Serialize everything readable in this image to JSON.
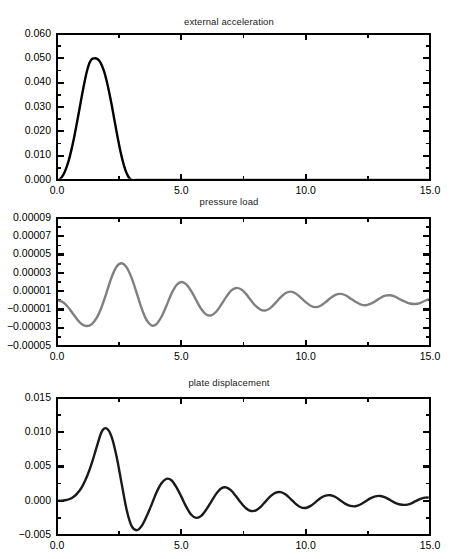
{
  "figure": {
    "background": "#ffffff",
    "width": 458,
    "height": 559
  },
  "chart_data": [
    {
      "type": "line",
      "title": "external acceleration",
      "xlabel": "",
      "ylabel": "",
      "xlim": [
        0.0,
        15.0
      ],
      "ylim": [
        0.0,
        0.06
      ],
      "grid": false,
      "legend": null,
      "color": "#000000",
      "linewidth": 2.4,
      "xticks": [
        0.0,
        5.0,
        10.0,
        15.0
      ],
      "xticklabels": [
        "0.0",
        "5.0",
        "10.0",
        "15.0"
      ],
      "xminorticks": [
        2.5,
        7.5,
        12.5
      ],
      "yticks": [
        0.0,
        0.01,
        0.02,
        0.03,
        0.04,
        0.05,
        0.06
      ],
      "yticklabels": [
        "0.000",
        "0.010",
        "0.020",
        "0.030",
        "0.040",
        "0.050",
        "0.060"
      ],
      "yminorticks": [
        0.005,
        0.015,
        0.025,
        0.035,
        0.045,
        0.055
      ],
      "x": [
        0.0,
        0.1,
        0.2,
        0.3,
        0.4,
        0.5,
        0.6,
        0.7,
        0.8,
        0.9,
        1.0,
        1.1,
        1.2,
        1.3,
        1.4,
        1.5,
        1.6,
        1.7,
        1.8,
        1.9,
        2.0,
        2.1,
        2.2,
        2.3,
        2.4,
        2.5,
        2.6,
        2.7,
        2.8,
        2.9,
        3.0,
        3.2,
        3.5,
        4.0,
        5.0,
        6.0,
        7.0,
        8.0,
        9.0,
        10.0,
        11.0,
        12.0,
        13.0,
        14.0,
        15.0
      ],
      "y": [
        0.0,
        0.0003,
        0.0013,
        0.0031,
        0.0057,
        0.0091,
        0.0133,
        0.0181,
        0.0234,
        0.029,
        0.0346,
        0.0399,
        0.0446,
        0.048,
        0.0497,
        0.05,
        0.0499,
        0.049,
        0.0472,
        0.0444,
        0.0406,
        0.036,
        0.0308,
        0.0252,
        0.0196,
        0.0143,
        0.0096,
        0.0057,
        0.0028,
        0.0009,
        0.0,
        0.0,
        0.0,
        0.0,
        0.0,
        0.0,
        0.0,
        0.0,
        0.0,
        0.0,
        0.0,
        0.0,
        0.0,
        0.0,
        0.0
      ]
    },
    {
      "type": "line",
      "title": "pressure load",
      "xlabel": "",
      "ylabel": "",
      "xlim": [
        0.0,
        15.0
      ],
      "ylim": [
        -5e-05,
        9e-05
      ],
      "grid": false,
      "legend": null,
      "color": "#808080",
      "linewidth": 2.4,
      "xticks": [
        0.0,
        5.0,
        10.0,
        15.0
      ],
      "xticklabels": [
        "0.0",
        "5.0",
        "10.0",
        "15.0"
      ],
      "xminorticks": [
        2.5,
        7.5,
        12.5
      ],
      "yticks": [
        -5e-05,
        -3e-05,
        -1e-05,
        1e-05,
        3e-05,
        5e-05,
        7e-05,
        9e-05
      ],
      "yticklabels": [
        "−0.00005",
        "−0.00003",
        "−0.00001",
        "0.00001",
        "0.00003",
        "0.00005",
        "0.00007",
        "0.00009"
      ],
      "yminorticks": [
        -4e-05,
        -2e-05,
        0.0,
        2e-05,
        4e-05,
        6e-05,
        8e-05
      ],
      "x": [
        0.0,
        0.2,
        0.4,
        0.6,
        0.8,
        1.0,
        1.2,
        1.4,
        1.6,
        1.8,
        2.0,
        2.2,
        2.4,
        2.6,
        2.8,
        3.0,
        3.2,
        3.4,
        3.6,
        3.8,
        4.0,
        4.2,
        4.4,
        4.6,
        4.8,
        5.0,
        5.2,
        5.4,
        5.6,
        5.8,
        6.0,
        6.2,
        6.4,
        6.6,
        6.8,
        7.0,
        7.2,
        7.4,
        7.6,
        7.8,
        8.0,
        8.2,
        8.4,
        8.6,
        8.8,
        9.0,
        9.2,
        9.4,
        9.6,
        9.8,
        10.0,
        10.2,
        10.4,
        10.6,
        10.8,
        11.0,
        11.2,
        11.4,
        11.6,
        11.8,
        12.0,
        12.2,
        12.4,
        12.6,
        12.8,
        13.0,
        13.2,
        13.4,
        13.6,
        13.8,
        14.0,
        14.2,
        14.4,
        14.6,
        14.8,
        15.0
      ],
      "y": [
        0.0,
        -1.5e-06,
        -6e-06,
        -1.3e-05,
        -2.05e-05,
        -2.62e-05,
        -2.82e-05,
        -2.6e-05,
        -1.9e-05,
        -7e-06,
        9e-06,
        2.55e-05,
        3.7e-05,
        4.05e-05,
        3.6e-05,
        2.45e-05,
        8.5e-06,
        -8.5e-06,
        -2.15e-05,
        -2.75e-05,
        -2.6e-05,
        -1.8e-05,
        -6e-06,
        7e-06,
        1.65e-05,
        2e-05,
        1.75e-05,
        1e-05,
        0.0,
        -9.5e-06,
        -1.55e-05,
        -1.65e-05,
        -1.25e-05,
        -5e-06,
        3.5e-06,
        1.05e-05,
        1.35e-05,
        1.2e-05,
        7e-06,
        0.0,
        -6.5e-06,
        -1.05e-05,
        -1.1e-05,
        -8e-06,
        -2.5e-06,
        3.5e-06,
        8e-06,
        9.5e-06,
        7.5e-06,
        3e-06,
        -2e-06,
        -6e-06,
        -7.5e-06,
        -6e-06,
        -2e-06,
        2.5e-06,
        6e-06,
        7e-06,
        5.5e-06,
        2e-06,
        -1.5e-06,
        -4.5e-06,
        -5.5e-06,
        -4e-06,
        -1e-06,
        2.5e-06,
        5e-06,
        5.5e-06,
        4e-06,
        1e-06,
        -1.5e-06,
        -3.5e-06,
        -4e-06,
        -3e-06,
        -5e-07,
        1.5e-06
      ]
    },
    {
      "type": "line",
      "title": "plate displacement",
      "xlabel": "",
      "ylabel": "",
      "xlim": [
        0.0,
        15.0
      ],
      "ylim": [
        -0.005,
        0.015
      ],
      "grid": false,
      "legend": null,
      "color": "#1a1a1a",
      "linewidth": 2.4,
      "xticks": [
        0.0,
        5.0,
        10.0,
        15.0
      ],
      "xticklabels": [
        "0.0",
        "5.0",
        "10.0",
        "15.0"
      ],
      "xminorticks": [
        2.5,
        7.5,
        12.5
      ],
      "yticks": [
        -0.005,
        0.0,
        0.005,
        0.01,
        0.015
      ],
      "yticklabels": [
        "−0.005",
        "0.000",
        "0.005",
        "0.010",
        "0.015"
      ],
      "yminorticks": [
        -0.0025,
        0.0025,
        0.0075,
        0.0125
      ],
      "x": [
        0.0,
        0.2,
        0.4,
        0.6,
        0.8,
        1.0,
        1.2,
        1.4,
        1.6,
        1.8,
        2.0,
        2.2,
        2.4,
        2.6,
        2.8,
        3.0,
        3.2,
        3.4,
        3.6,
        3.8,
        4.0,
        4.2,
        4.4,
        4.6,
        4.8,
        5.0,
        5.2,
        5.4,
        5.6,
        5.8,
        6.0,
        6.2,
        6.4,
        6.6,
        6.8,
        7.0,
        7.2,
        7.4,
        7.6,
        7.8,
        8.0,
        8.2,
        8.4,
        8.6,
        8.8,
        9.0,
        9.2,
        9.4,
        9.6,
        9.8,
        10.0,
        10.2,
        10.4,
        10.6,
        10.8,
        11.0,
        11.2,
        11.4,
        11.6,
        11.8,
        12.0,
        12.2,
        12.4,
        12.6,
        12.8,
        13.0,
        13.2,
        13.4,
        13.6,
        13.8,
        14.0,
        14.2,
        14.4,
        14.6,
        14.8,
        15.0
      ],
      "y": [
        0.0,
        2e-05,
        0.00012,
        0.0004,
        0.001,
        0.002,
        0.0035,
        0.0055,
        0.0079,
        0.0101,
        0.01055,
        0.0093,
        0.0064,
        0.0025,
        -0.0013,
        -0.0037,
        -0.0043,
        -0.0037,
        -0.0023,
        -0.0006,
        0.0012,
        0.00255,
        0.0032,
        0.003,
        0.002,
        0.0006,
        -0.0009,
        -0.00205,
        -0.0025,
        -0.0022,
        -0.0013,
        -0.00015,
        0.001,
        0.0018,
        0.00195,
        0.0015,
        0.00065,
        -0.0003,
        -0.0011,
        -0.0015,
        -0.0014,
        -0.00085,
        -5e-05,
        0.0007,
        0.0012,
        0.00125,
        0.0009,
        0.00025,
        -0.00045,
        -0.00095,
        -0.00105,
        -0.00075,
        -0.0002,
        0.0004,
        0.00075,
        0.0008,
        0.00055,
        5e-05,
        -0.00045,
        -0.00075,
        -0.0008,
        -0.00055,
        -0.0001,
        0.00035,
        0.00065,
        0.0007,
        0.0005,
        0.0001,
        -0.0003,
        -0.00055,
        -0.0006,
        -0.00045,
        -0.0001,
        0.00025,
        0.00045,
        0.00048
      ]
    }
  ]
}
